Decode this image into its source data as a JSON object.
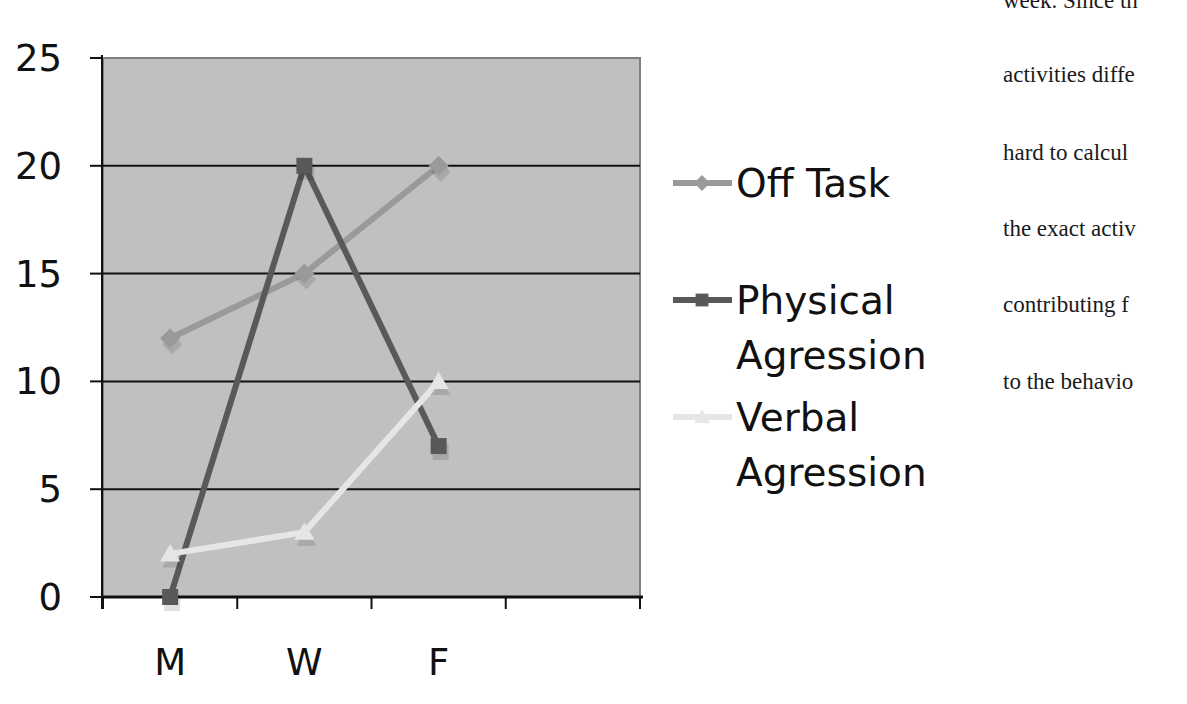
{
  "chart_data": {
    "type": "line",
    "title": "",
    "xlabel": "",
    "ylabel": "",
    "categories": [
      "M",
      "W",
      "F"
    ],
    "x_slots": 4,
    "ylim": [
      0,
      25
    ],
    "yticks": [
      0,
      5,
      10,
      15,
      20,
      25
    ],
    "grid": true,
    "legend_position": "right",
    "plot_background": "#c0c0c0",
    "series": [
      {
        "name": "Off Task",
        "values": [
          12,
          15,
          20
        ],
        "color": "#9a9a9a",
        "marker": "diamond"
      },
      {
        "name": "Physical Agression",
        "values": [
          0,
          20,
          7
        ],
        "color": "#595959",
        "marker": "square"
      },
      {
        "name": "Verbal Agression",
        "values": [
          2,
          3,
          10
        ],
        "color": "#e6e6e6",
        "marker": "triangle"
      }
    ]
  },
  "legend": {
    "items": [
      {
        "lines": [
          "Off Task"
        ]
      },
      {
        "lines": [
          "Physical",
          "Agression"
        ]
      },
      {
        "lines": [
          "Verbal",
          "Agression"
        ]
      }
    ]
  },
  "body_text": {
    "lines": [
      "week. Since th",
      "activities diffe",
      "hard to calcul",
      "the exact activ",
      "contributing f",
      "to the behavio"
    ]
  }
}
